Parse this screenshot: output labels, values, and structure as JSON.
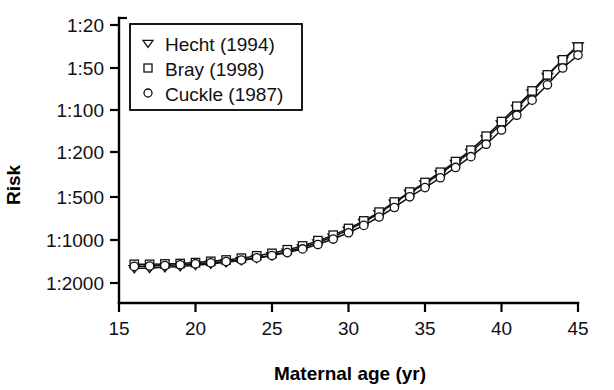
{
  "chart_data": {
    "type": "line",
    "title": "",
    "xlabel": "Maternal age (yr)",
    "ylabel": "Risk",
    "xlim": [
      15,
      45
    ],
    "ylim_labels": [
      "1:20",
      "1:50",
      "1:100",
      "1:200",
      "1:500",
      "1:1000",
      "1:2000"
    ],
    "y_tick_values": [
      20,
      50,
      100,
      200,
      500,
      1000,
      2000
    ],
    "y_scale": "log-reciprocal-inverted",
    "x_ticks": [
      15,
      20,
      25,
      30,
      35,
      40,
      45
    ],
    "x_tick_labels": [
      "15",
      "20",
      "25",
      "30",
      "35",
      "40",
      "45"
    ],
    "grid": false,
    "legend_position": "top-left-inside",
    "x": [
      16,
      17,
      18,
      19,
      20,
      21,
      22,
      23,
      24,
      25,
      26,
      27,
      28,
      29,
      30,
      31,
      32,
      33,
      34,
      35,
      36,
      37,
      38,
      39,
      40,
      41,
      42,
      43,
      44,
      45
    ],
    "series": [
      {
        "name": "Hecht (1994)",
        "marker": "triangle-down",
        "values": [
          1580,
          1570,
          1550,
          1530,
          1500,
          1470,
          1430,
          1390,
          1340,
          1280,
          1210,
          1130,
          1040,
          950,
          850,
          750,
          650,
          550,
          460,
          380,
          310,
          250,
          200,
          160,
          125,
          97,
          75,
          57,
          42,
          31
        ]
      },
      {
        "name": "Bray (1998)",
        "marker": "square",
        "values": [
          1480,
          1480,
          1470,
          1460,
          1440,
          1410,
          1380,
          1340,
          1290,
          1240,
          1170,
          1100,
          1010,
          925,
          830,
          735,
          638,
          542,
          452,
          372,
          302,
          243,
          194,
          154,
          121,
          94,
          73,
          56,
          42,
          32
        ]
      },
      {
        "name": "Cuckle (1987)",
        "marker": "circle",
        "values": [
          1530,
          1520,
          1510,
          1490,
          1470,
          1445,
          1415,
          1380,
          1335,
          1285,
          1225,
          1155,
          1075,
          985,
          890,
          790,
          690,
          592,
          498,
          413,
          338,
          274,
          220,
          176,
          139,
          109,
          85,
          66,
          50,
          38
        ]
      }
    ],
    "marker_glyphs": {
      "triangle-down": "▽",
      "square": "□",
      "circle": "○"
    }
  },
  "legend": {
    "items": [
      {
        "label": "Hecht (1994)",
        "marker": "triangle-down"
      },
      {
        "label": "Bray (1998)",
        "marker": "square"
      },
      {
        "label": "Cuckle (1987)",
        "marker": "circle"
      }
    ]
  },
  "axes": {
    "y_title": "Risk",
    "x_title": "Maternal age (yr)"
  },
  "colors": {
    "background": "#ffffff",
    "foreground": "#000000",
    "line": "#111111",
    "marker_fill": "#ffffff"
  }
}
